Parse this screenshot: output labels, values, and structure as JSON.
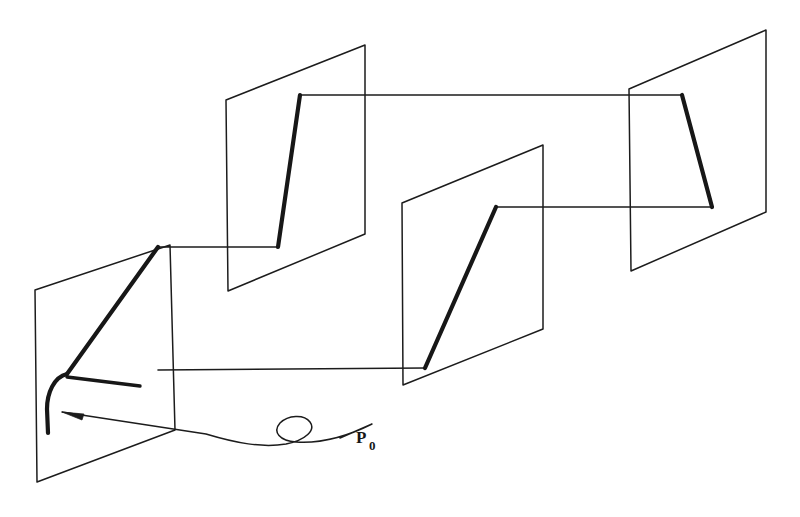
{
  "figure": {
    "background_color": "#ffffff",
    "ink_color": "#1c1c1c",
    "thick_ink_color": "#171717",
    "canvas": {
      "width": 800,
      "height": 517
    }
  },
  "labels": {
    "p_zero": {
      "base": "P",
      "subscript": "0",
      "x": 356,
      "y": 443
    }
  },
  "planes": [
    {
      "name": "plane-1",
      "order": 1,
      "corners": [
        [
          35,
          290
        ],
        [
          170,
          245
        ],
        [
          175,
          430
        ],
        [
          37,
          482
        ]
      ],
      "closed": true
    },
    {
      "name": "plane-2",
      "order": 2,
      "corners": [
        [
          226,
          100
        ],
        [
          365,
          45
        ],
        [
          365,
          234
        ],
        [
          228,
          291
        ]
      ],
      "closed": true
    },
    {
      "name": "plane-3",
      "order": 3,
      "corners": [
        [
          402,
          203
        ],
        [
          543,
          145
        ],
        [
          543,
          329
        ],
        [
          403,
          385
        ]
      ],
      "closed": true
    },
    {
      "name": "plane-4",
      "order": 4,
      "corners": [
        [
          629,
          89
        ],
        [
          766,
          30
        ],
        [
          766,
          212
        ],
        [
          631,
          271
        ]
      ],
      "closed": true
    }
  ],
  "trajectory": {
    "name": "piecewise-path",
    "description": "Thick polyline that threads through the four planes, starting with a hooked curve inside plane 1",
    "thick_segments": [
      {
        "name": "hook-curve-plane-1",
        "d": "M 67 374 C 54 377 47 393 47 409 L 48 433"
      },
      {
        "name": "rise-plane-1",
        "d": "M 67 374 L 158 247"
      },
      {
        "name": "stub-tail-plane-1",
        "d": "M 67 377 L 140 386"
      },
      {
        "name": "rise-plane-2",
        "d": "M 278 247 L 300 95"
      },
      {
        "name": "rise-plane-3",
        "d": "M 425 368 L 496 207"
      },
      {
        "name": "fall-plane-4",
        "d": "M 682 95 L 712 207"
      }
    ],
    "thin_segments": [
      {
        "name": "connector-1-to-2",
        "d": "M 158 247 L 278 247"
      },
      {
        "name": "connector-2-to-4-upper",
        "d": "M 300 95 L 682 95"
      },
      {
        "name": "connector-3-to-4-lower",
        "d": "M 496 207 L 712 207"
      },
      {
        "name": "connector-1-to-3-lower",
        "d": "M 158 370 L 425 368"
      }
    ]
  },
  "annotation": {
    "name": "p0-leader",
    "wavy_leader_d": "M 62 412 L 206 434 C 236 443 262 448 286 444 C 306 440 316 430 310 422 C 304 414 288 415 280 423 C 272 432 280 441 296 442 C 326 444 352 434 372 424 L 340 438",
    "arrow_tip": [
      62,
      412
    ],
    "arrow_polygon": "62,412 84,414 82,420"
  }
}
